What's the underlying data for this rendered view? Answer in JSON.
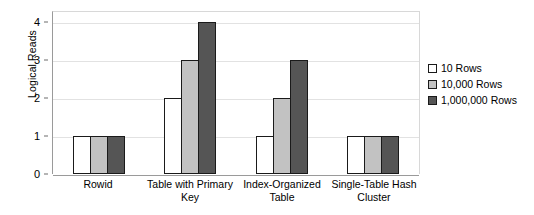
{
  "chart_data": {
    "type": "bar",
    "title": "",
    "xlabel": "",
    "ylabel": "Logical Reads",
    "categories": [
      "Rowid",
      "Table with Primary Key",
      "Index-Organized Table",
      "Single-Table Hash Cluster"
    ],
    "series": [
      {
        "name": "10 Rows",
        "color": "#ffffff",
        "values": [
          1,
          2,
          1,
          1
        ]
      },
      {
        "name": "10,000 Rows",
        "color": "#c2c2c2",
        "values": [
          1,
          3,
          2,
          1
        ]
      },
      {
        "name": "1,000,000 Rows",
        "color": "#555555",
        "values": [
          1,
          4,
          3,
          1
        ]
      }
    ],
    "ylim": [
      0,
      4.3
    ],
    "yticks": [
      0,
      1,
      2,
      3,
      4
    ],
    "ytick_labels": [
      "0",
      "1",
      "2",
      "3",
      "4"
    ],
    "grid": true,
    "legend_position": "right",
    "bar_outline_color": "#1a1a1a",
    "axis_color": "#9a9a9a",
    "grid_color": "#e2e2e2",
    "background": "#ffffff"
  }
}
